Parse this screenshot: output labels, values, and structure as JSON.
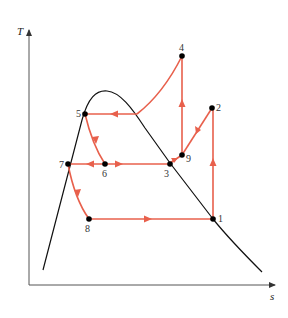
{
  "axes": {
    "y_label": "T",
    "x_label": "s"
  },
  "colors": {
    "cycle": "#e8604c",
    "dome": "#111111",
    "axis": "#555555",
    "point": "#000000"
  },
  "points": [
    {
      "id": "1",
      "label": "1"
    },
    {
      "id": "2",
      "label": "2"
    },
    {
      "id": "3",
      "label": "3"
    },
    {
      "id": "4",
      "label": "4"
    },
    {
      "id": "5",
      "label": "5"
    },
    {
      "id": "6",
      "label": "6"
    },
    {
      "id": "7",
      "label": "7"
    },
    {
      "id": "8",
      "label": "8"
    },
    {
      "id": "9",
      "label": "9"
    }
  ],
  "processes": [
    {
      "from": "1",
      "to": "2",
      "shape": "vertical"
    },
    {
      "from": "2",
      "to": "9",
      "shape": "line"
    },
    {
      "from": "9",
      "to": "4",
      "shape": "vertical"
    },
    {
      "from": "3",
      "to": "9",
      "shape": "line"
    },
    {
      "from": "4",
      "to": "dome-right",
      "shape": "curve"
    },
    {
      "from": "dome-right",
      "to": "5",
      "shape": "horizontal"
    },
    {
      "from": "5",
      "to": "6",
      "shape": "curve"
    },
    {
      "from": "6",
      "to": "7",
      "shape": "horizontal"
    },
    {
      "from": "6",
      "to": "3",
      "shape": "horizontal"
    },
    {
      "from": "7",
      "to": "8",
      "shape": "curve"
    },
    {
      "from": "8",
      "to": "1",
      "shape": "horizontal"
    }
  ]
}
